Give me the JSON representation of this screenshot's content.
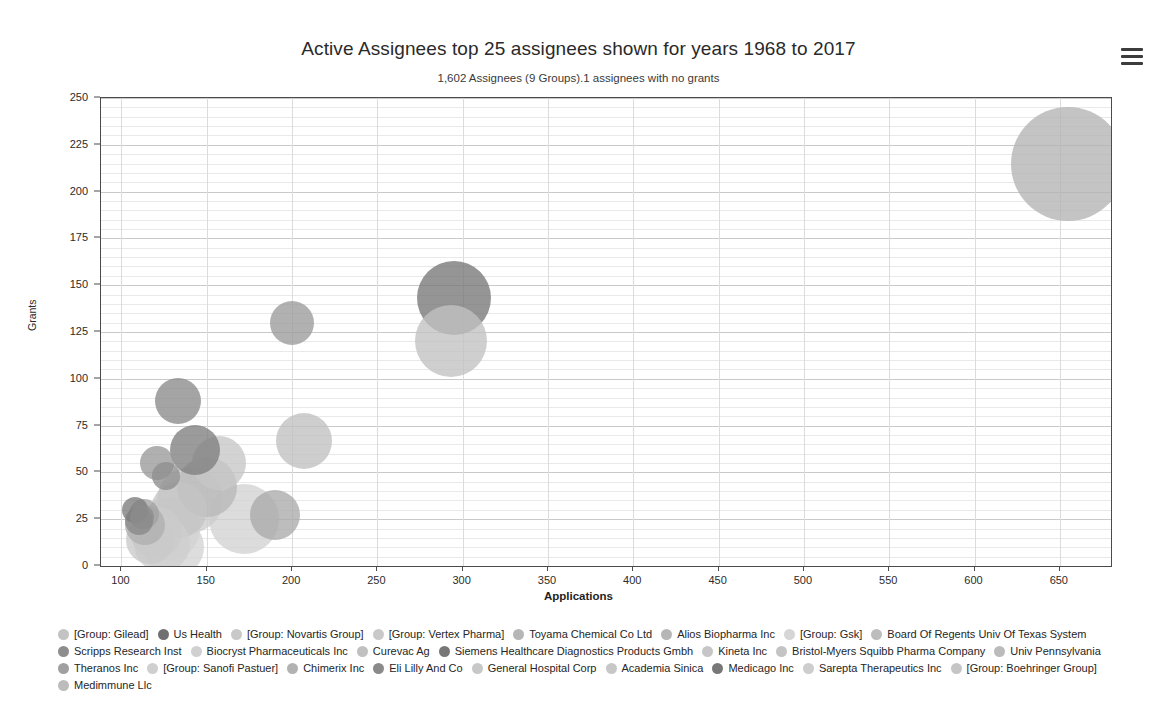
{
  "header": {
    "title": "Active Assignees top 25 assignees shown for years 1968 to 2017",
    "subtitle": "1,602 Assignees (9 Groups).1 assignees with no grants",
    "menu_icon": "hamburger-menu-icon"
  },
  "chart_data": {
    "type": "scatter",
    "title": "Active Assignees top 25 assignees shown for years 1968 to 2017",
    "subtitle": "1,602 Assignees (9 Groups).1 assignees with no grants",
    "xlabel": "Applications",
    "ylabel": "Grants",
    "xlim": [
      88,
      680
    ],
    "ylim": [
      0,
      250
    ],
    "xticks": [
      100,
      150,
      200,
      250,
      300,
      350,
      400,
      450,
      500,
      550,
      600,
      650
    ],
    "yticks": [
      0,
      25,
      50,
      75,
      100,
      125,
      150,
      175,
      200,
      225,
      250
    ],
    "grid": true,
    "grid_minor_y_step": 5,
    "legend_position": "bottom",
    "points": [
      {
        "name": "[Group: Gilead]",
        "x": 655,
        "y": 215,
        "r": 57,
        "color": "#b4b4b4"
      },
      {
        "name": "Us Health",
        "x": 295,
        "y": 143,
        "r": 37,
        "color": "#777777"
      },
      {
        "name": "[Group: Novartis Group]",
        "x": 293,
        "y": 120,
        "r": 36,
        "color": "#c2c2c2"
      },
      {
        "name": "[Group: Vertex Pharma]",
        "x": 200,
        "y": 130,
        "r": 22,
        "color": "#9b9b9b"
      },
      {
        "name": "Toyama Chemical Co Ltd",
        "x": 207,
        "y": 67,
        "r": 28,
        "color": "#c0c0c0"
      },
      {
        "name": "Alios Biopharma Inc",
        "x": 190,
        "y": 27,
        "r": 25,
        "color": "#aaaaaa"
      },
      {
        "name": "[Group: Gsk]",
        "x": 172,
        "y": 25,
        "r": 35,
        "color": "#d2d2d2"
      },
      {
        "name": "Board Of Regents Univ Of Texas System",
        "x": 133,
        "y": 88,
        "r": 23,
        "color": "#8a8a8a"
      },
      {
        "name": "Scripps Research Inst",
        "x": 143,
        "y": 62,
        "r": 25,
        "color": "#7f7f7f"
      },
      {
        "name": "Biocryst Pharmaceuticals Inc",
        "x": 157,
        "y": 55,
        "r": 27,
        "color": "#c6c6c6"
      },
      {
        "name": "Curevac Ag",
        "x": 150,
        "y": 42,
        "r": 30,
        "color": "#b9b9b9"
      },
      {
        "name": "Siemens Healthcare Diagnostics Products Gmbh",
        "x": 121,
        "y": 55,
        "r": 17,
        "color": "#9a9a9a"
      },
      {
        "name": "Kineta Inc",
        "x": 140,
        "y": 35,
        "r": 33,
        "color": "#cdcdcd"
      },
      {
        "name": "Bristol-Myers Squibb Pharma Company",
        "x": 126,
        "y": 48,
        "r": 14,
        "color": "#8e8e8e"
      },
      {
        "name": "Univ Pennsylvania",
        "x": 134,
        "y": 30,
        "r": 28,
        "color": "#c4c4c4"
      },
      {
        "name": "Theranos Inc",
        "x": 113,
        "y": 28,
        "r": 15,
        "color": "#a1a1a1"
      },
      {
        "name": "[Group: Sanofi Pastuer]",
        "x": 128,
        "y": 20,
        "r": 31,
        "color": "#d0d0d0"
      },
      {
        "name": "Chimerix Inc",
        "x": 112,
        "y": 26,
        "r": 12,
        "color": "#8d8d8d"
      },
      {
        "name": "Eli Lilly And Co",
        "x": 110,
        "y": 24,
        "r": 14,
        "color": "#888888"
      },
      {
        "name": "General Hospital Corp",
        "x": 120,
        "y": 18,
        "r": 26,
        "color": "#cacaca"
      },
      {
        "name": "Academia Sinica",
        "x": 117,
        "y": 14,
        "r": 24,
        "color": "#c9c9c9"
      },
      {
        "name": "Medicago Inc",
        "x": 108,
        "y": 30,
        "r": 13,
        "color": "#7c7c7c"
      },
      {
        "name": "Sarepta Therapeutics Inc",
        "x": 124,
        "y": 12,
        "r": 28,
        "color": "#cecece"
      },
      {
        "name": "[Group: Boehringer Group]",
        "x": 131,
        "y": 10,
        "r": 30,
        "color": "#d4d4d4"
      },
      {
        "name": "Medimmune Llc",
        "x": 114,
        "y": 22,
        "r": 20,
        "color": "#b0b0b0"
      }
    ]
  },
  "legend": {
    "items": [
      {
        "label": "[Group: Gilead]",
        "color": "#c3c3c3"
      },
      {
        "label": "Us Health",
        "color": "#707070"
      },
      {
        "label": "[Group: Novartis Group]",
        "color": "#c9c9c9"
      },
      {
        "label": "[Group: Vertex Pharma]",
        "color": "#c9c9c9"
      },
      {
        "label": "Toyama Chemical Co Ltd",
        "color": "#b6b6b6"
      },
      {
        "label": "Alios Biopharma Inc",
        "color": "#b6b6b6"
      },
      {
        "label": "[Group: Gsk]",
        "color": "#d6d6d6"
      },
      {
        "label": "Board Of Regents Univ Of Texas System",
        "color": "#bdbdbd"
      },
      {
        "label": "Scripps Research Inst",
        "color": "#8d8d8d"
      },
      {
        "label": "Biocryst Pharmaceuticals Inc",
        "color": "#d0d0d0"
      },
      {
        "label": "Curevac Ag",
        "color": "#c0c0c0"
      },
      {
        "label": "Siemens Healthcare Diagnostics Products Gmbh",
        "color": "#777777"
      },
      {
        "label": "Kineta Inc",
        "color": "#c6c6c6"
      },
      {
        "label": "Bristol-Myers Squibb Pharma Company",
        "color": "#c4c4c4"
      },
      {
        "label": "Univ Pennsylvania",
        "color": "#bbbbbb"
      },
      {
        "label": "Theranos Inc",
        "color": "#a0a0a0"
      },
      {
        "label": "[Group: Sanofi Pastuer]",
        "color": "#cfcfcf"
      },
      {
        "label": "Chimerix Inc",
        "color": "#b2b2b2"
      },
      {
        "label": "Eli Lilly And Co",
        "color": "#8a8a8a"
      },
      {
        "label": "General Hospital Corp",
        "color": "#c8c8c8"
      },
      {
        "label": "Academia Sinica",
        "color": "#c7c7c7"
      },
      {
        "label": "Medicago Inc",
        "color": "#787878"
      },
      {
        "label": "Sarepta Therapeutics Inc",
        "color": "#cdcdcd"
      },
      {
        "label": "[Group: Boehringer Group]",
        "color": "#c5c5c5"
      },
      {
        "label": "Medimmune Llc",
        "color": "#bcbcbc"
      }
    ]
  }
}
